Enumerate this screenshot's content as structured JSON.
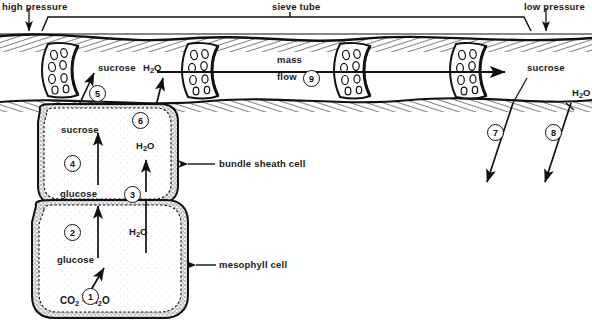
{
  "figure": {
    "top_labels": {
      "high_pressure": "high  pressure",
      "sieve_tube": "sieve tube",
      "low_pressure": "low  pressure"
    },
    "callouts": {
      "bundle_sheath_cell": "bundle sheath cell",
      "mesophyll_cell": "mesophyll cell"
    },
    "sieve_tube_labels": {
      "sucrose_left": "sucrose",
      "h2o_left": "H2O",
      "mass": "mass",
      "flow": "flow",
      "sucrose_right": "sucrose",
      "h2o_right": "H2O"
    },
    "cell_labels": {
      "sucrose_out": "sucrose",
      "glucose_mid": "glucose",
      "h2o_bundle": "H2O",
      "glucose_low": "glucose",
      "h2o_mesophyll": "H2O",
      "co2_water": "CO2 + H2O"
    },
    "step_numbers": [
      "1",
      "2",
      "3",
      "4",
      "5",
      "6",
      "7",
      "8",
      "9"
    ],
    "colors": {
      "ink": "#111111",
      "paper": "#ffffff",
      "shade": "#8a8a8a"
    }
  }
}
